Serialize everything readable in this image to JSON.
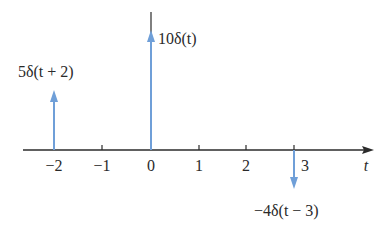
{
  "diagram": {
    "axis_label": "t",
    "ticks": [
      {
        "value": -2,
        "label": "−2",
        "x": 54
      },
      {
        "value": -1,
        "label": "−1",
        "x": 102
      },
      {
        "value": 0,
        "label": "0",
        "x": 151
      },
      {
        "value": 1,
        "label": "1",
        "x": 199
      },
      {
        "value": 2,
        "label": "2",
        "x": 246
      },
      {
        "value": 3,
        "label": "3",
        "x": 294
      }
    ],
    "impulses": [
      {
        "t": -2,
        "weight": 5,
        "label": "5δ(t + 2)"
      },
      {
        "t": 0,
        "weight": 10,
        "label": "10δ(t)"
      },
      {
        "t": 3,
        "weight": -4,
        "label": "−4δ(t − 3)"
      }
    ],
    "colors": {
      "axis": "#2b2b2b",
      "impulse": "#6f9fd8"
    }
  }
}
